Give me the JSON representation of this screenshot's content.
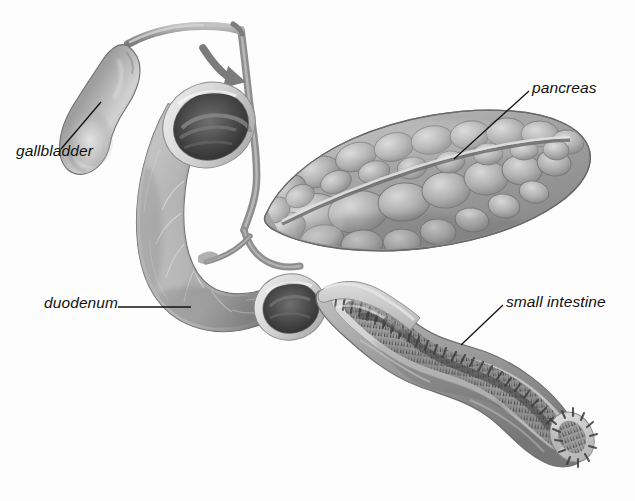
{
  "figure": {
    "background_color": "#fdfdfd",
    "width": 635,
    "height": 501,
    "style": "grayscale medical airbrush illustration",
    "label_color": "#111111"
  },
  "labels": {
    "gallbladder": "gallbladder",
    "duodenum": "duodenum",
    "pancreas": "pancreas",
    "small_intestine": "small intestine"
  },
  "leaders": {
    "gallbladder": {
      "from_x": 101,
      "from_y": 102,
      "to_x": 61,
      "to_y": 149,
      "kind": "diagonal"
    },
    "duodenum": {
      "from_x": 118,
      "from_y": 307,
      "to_x": 191,
      "to_y": 307,
      "kind": "horizontal"
    },
    "pancreas": {
      "from_x": 529,
      "from_y": 91,
      "to_x": 454,
      "to_y": 159,
      "kind": "diagonal"
    },
    "small_intestine": {
      "from_x": 503,
      "from_y": 305,
      "to_x": 461,
      "to_y": 345,
      "kind": "diagonal"
    }
  },
  "structures": {
    "gallbladder": {
      "name": "gallbladder",
      "shape": "pear",
      "tone": "#8e8e8e"
    },
    "cystic_duct": {
      "name": "cystic-duct",
      "tone": "#9a9a9a"
    },
    "common_bile_duct": {
      "name": "common-bile-duct",
      "tone": "#8f8f8f"
    },
    "flow_arrow": {
      "name": "bile-flow-arrow",
      "direction": "down-right",
      "tone": "#7f7f7f"
    },
    "duodenum": {
      "name": "duodenum",
      "shape": "C-loop",
      "tone": "#8a8a8a",
      "cut_ends": 2
    },
    "pancreas": {
      "name": "pancreas",
      "shape": "lobulated elongated",
      "tone": "#9b9b9b",
      "has_duct": true
    },
    "small_intestine": {
      "name": "small-intestine",
      "shape": "sigmoid longitudinal section",
      "tone": "#9a9a9a",
      "lining": "villi"
    }
  },
  "palette": {
    "background": "#fdfdfd",
    "tissue_light": "#cfcfcf",
    "tissue_mid": "#9a9a9a",
    "tissue_dark": "#5e5e5e",
    "lumen_dark": "#3a3a3a",
    "villi": "#4a4a4a",
    "outline": "#6a6a6a",
    "label_text": "#111111"
  }
}
